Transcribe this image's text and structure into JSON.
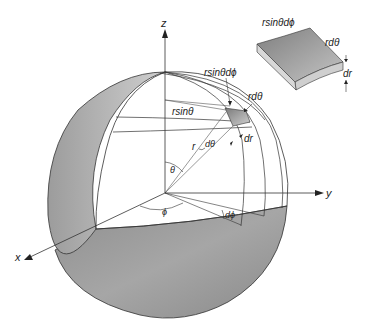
{
  "diagram": {
    "axes": {
      "x": "x",
      "y": "y",
      "z": "z"
    },
    "labels": {
      "rsin_theta_dphi": "rsinθdϕ",
      "r_dtheta": "rdθ",
      "r_sin_theta": "rsinθ",
      "dr": "dr",
      "r": "r",
      "dtheta": "dθ",
      "theta": "θ",
      "phi": "ϕ",
      "dphi": "dϕ"
    },
    "inset": {
      "top_label": "rsinθdϕ",
      "side_label": "rdθ",
      "thickness_label": "dr"
    },
    "colors": {
      "shading": "#9a9a9a",
      "shading_light": "#c8c8c8",
      "line": "#333333",
      "background": "#ffffff"
    }
  }
}
